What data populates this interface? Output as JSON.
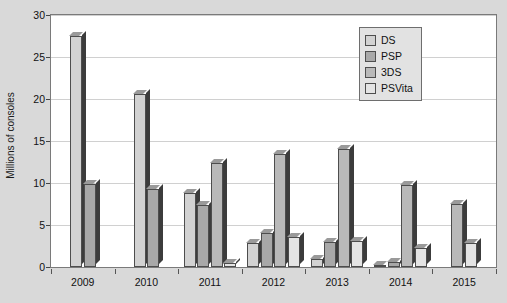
{
  "chart_data": {
    "type": "bar",
    "title": "",
    "xlabel": "",
    "ylabel": "Millions of consoles",
    "ylim": [
      0,
      30
    ],
    "yticks": [
      0,
      5,
      10,
      15,
      20,
      25,
      30
    ],
    "grid": true,
    "legend_position": "top-right",
    "categories": [
      "2009",
      "2010",
      "2011",
      "2012",
      "2013",
      "2014",
      "2015"
    ],
    "series": [
      {
        "name": "DS",
        "color": "#d2d2d2",
        "values": [
          27.5,
          20.6,
          8.8,
          2.8,
          0.9,
          0.2,
          0
        ]
      },
      {
        "name": "PSP",
        "color": "#a8a8a8",
        "values": [
          9.9,
          9.3,
          7.4,
          4.1,
          3.0,
          0.6,
          0
        ]
      },
      {
        "name": "3DS",
        "color": "#b9b9b9",
        "values": [
          0,
          0,
          12.4,
          13.5,
          14.0,
          9.8,
          7.5
        ]
      },
      {
        "name": "PSVita",
        "color": "#e4e4e4",
        "values": [
          0,
          0,
          0.5,
          3.6,
          3.1,
          2.3,
          2.8
        ]
      }
    ]
  },
  "legend": {
    "items": [
      {
        "label": "DS"
      },
      {
        "label": "PSP"
      },
      {
        "label": "3DS"
      },
      {
        "label": "PSVita"
      }
    ]
  }
}
